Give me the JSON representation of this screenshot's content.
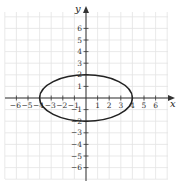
{
  "chart_data": {
    "type": "line",
    "title": "",
    "xlabel": "x",
    "ylabel": "y",
    "xlim": [
      -7,
      7
    ],
    "ylim": [
      -7,
      7
    ],
    "grid": true,
    "x_ticks": [
      -6,
      -5,
      -4,
      -3,
      -2,
      -1,
      1,
      2,
      3,
      4,
      5,
      6
    ],
    "y_ticks": [
      -6,
      -5,
      -4,
      -3,
      -2,
      -1,
      1,
      2,
      3,
      4,
      5,
      6
    ],
    "x_tick_labels": [
      "−6",
      "−5",
      "−4",
      "−3",
      "−2",
      "−1",
      "1",
      "2",
      "3",
      "4",
      "5",
      "6"
    ],
    "y_tick_labels": [
      "−6",
      "−5",
      "−4",
      "−3",
      "−2",
      "−1",
      "1",
      "2",
      "3",
      "4",
      "5",
      "6"
    ],
    "series": [
      {
        "name": "ellipse",
        "shape": "ellipse",
        "center": [
          0,
          0
        ],
        "semi_axis_x": 4,
        "semi_axis_y": 2,
        "equation": "x^2/16 + y^2/4 = 1",
        "key_points": [
          [
            4,
            0
          ],
          [
            0,
            2
          ],
          [
            -4,
            0
          ],
          [
            0,
            -2
          ]
        ]
      }
    ]
  },
  "colors": {
    "grid": "#e3e3e3",
    "axis": "#333333",
    "curve": "#222222"
  }
}
